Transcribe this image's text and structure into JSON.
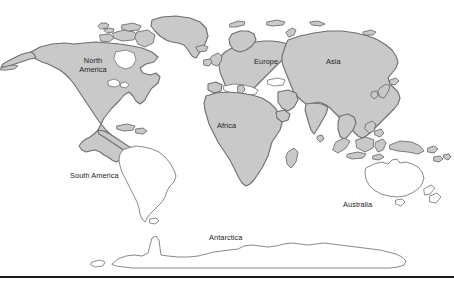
{
  "figure": {
    "name": "world-map",
    "width": 454,
    "height": 283,
    "background_color": "#ffffff"
  },
  "style": {
    "land_fill_color": "#c9c9c9",
    "land_stroke_color": "#6e6e6e",
    "outline_fill_color": "#ffffff",
    "outline_stroke_color": "#7a7a7a",
    "label_color": "#1e1e1e",
    "rule_color": "#1a1a1a"
  },
  "labels": {
    "north_america_line1": "North",
    "north_america_line2": "America",
    "europe": "Europe",
    "asia": "Asia",
    "africa": "Africa",
    "south_america": "South America",
    "australia": "Australia",
    "antarctica": "Antarctica"
  },
  "regions": [
    {
      "name": "north-america",
      "label": "North America",
      "shading": "filled"
    },
    {
      "name": "greenland",
      "label": "",
      "shading": "filled"
    },
    {
      "name": "europe",
      "label": "Europe",
      "shading": "filled"
    },
    {
      "name": "asia",
      "label": "Asia",
      "shading": "filled"
    },
    {
      "name": "africa",
      "label": "Africa",
      "shading": "filled"
    },
    {
      "name": "indonesia",
      "label": "",
      "shading": "filled"
    },
    {
      "name": "south-america",
      "label": "South America",
      "shading": "outline"
    },
    {
      "name": "australia",
      "label": "Australia",
      "shading": "outline"
    },
    {
      "name": "new-zealand",
      "label": "",
      "shading": "outline"
    },
    {
      "name": "antarctica",
      "label": "Antarctica",
      "shading": "outline"
    }
  ]
}
